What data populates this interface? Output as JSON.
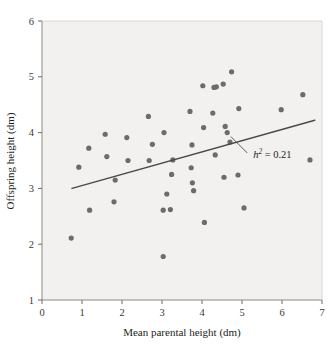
{
  "chart_data": {
    "type": "scatter",
    "title": "",
    "xlabel": "Mean parental height (dm)",
    "ylabel": "Offspring height (dm)",
    "xlim": [
      0,
      7
    ],
    "ylim": [
      1,
      6
    ],
    "xticks": [
      0,
      1,
      2,
      3,
      4,
      5,
      6,
      7
    ],
    "yticks": [
      1,
      2,
      3,
      4,
      5,
      6
    ],
    "xtick_labels": [
      "0",
      "1",
      "2",
      "3",
      "4",
      "5",
      "6",
      "7"
    ],
    "ytick_labels": [
      "1",
      "2",
      "3",
      "4",
      "5",
      "6"
    ],
    "grid": false,
    "legend": null,
    "point_color": "#6e6c6b",
    "line_color": "#4a4948",
    "plot_background": "#f2f1ef",
    "points": [
      [
        0.73,
        2.11
      ],
      [
        0.92,
        3.38
      ],
      [
        1.17,
        3.72
      ],
      [
        1.19,
        2.61
      ],
      [
        1.58,
        3.97
      ],
      [
        1.62,
        3.57
      ],
      [
        1.8,
        2.76
      ],
      [
        1.83,
        3.15
      ],
      [
        2.12,
        3.91
      ],
      [
        2.15,
        3.5
      ],
      [
        2.66,
        4.29
      ],
      [
        2.68,
        3.5
      ],
      [
        2.76,
        3.79
      ],
      [
        3.03,
        1.78
      ],
      [
        3.03,
        2.61
      ],
      [
        3.05,
        4.0
      ],
      [
        3.12,
        2.9
      ],
      [
        3.21,
        2.62
      ],
      [
        3.24,
        3.25
      ],
      [
        3.27,
        3.51
      ],
      [
        3.7,
        4.38
      ],
      [
        3.73,
        3.37
      ],
      [
        3.75,
        3.78
      ],
      [
        3.76,
        3.1
      ],
      [
        3.79,
        2.96
      ],
      [
        4.02,
        4.84
      ],
      [
        4.04,
        4.09
      ],
      [
        4.06,
        2.39
      ],
      [
        4.27,
        4.35
      ],
      [
        4.3,
        4.81
      ],
      [
        4.33,
        3.6
      ],
      [
        4.36,
        4.82
      ],
      [
        4.53,
        4.87
      ],
      [
        4.55,
        3.2
      ],
      [
        4.58,
        4.11
      ],
      [
        4.63,
        4.0
      ],
      [
        4.7,
        3.83
      ],
      [
        4.74,
        5.09
      ],
      [
        4.9,
        3.24
      ],
      [
        4.92,
        4.43
      ],
      [
        5.05,
        2.65
      ],
      [
        5.98,
        4.41
      ],
      [
        6.52,
        4.68
      ],
      [
        6.7,
        3.51
      ]
    ],
    "trendline": {
      "x0": 0.75,
      "y0": 3.0,
      "x1": 6.82,
      "y1": 4.22
    },
    "annotation": {
      "symbol": "h",
      "superscript": "2",
      "equals": " = 0.21",
      "full_text": "h² = 0.21",
      "x": 5.28,
      "y": 3.6
    }
  }
}
